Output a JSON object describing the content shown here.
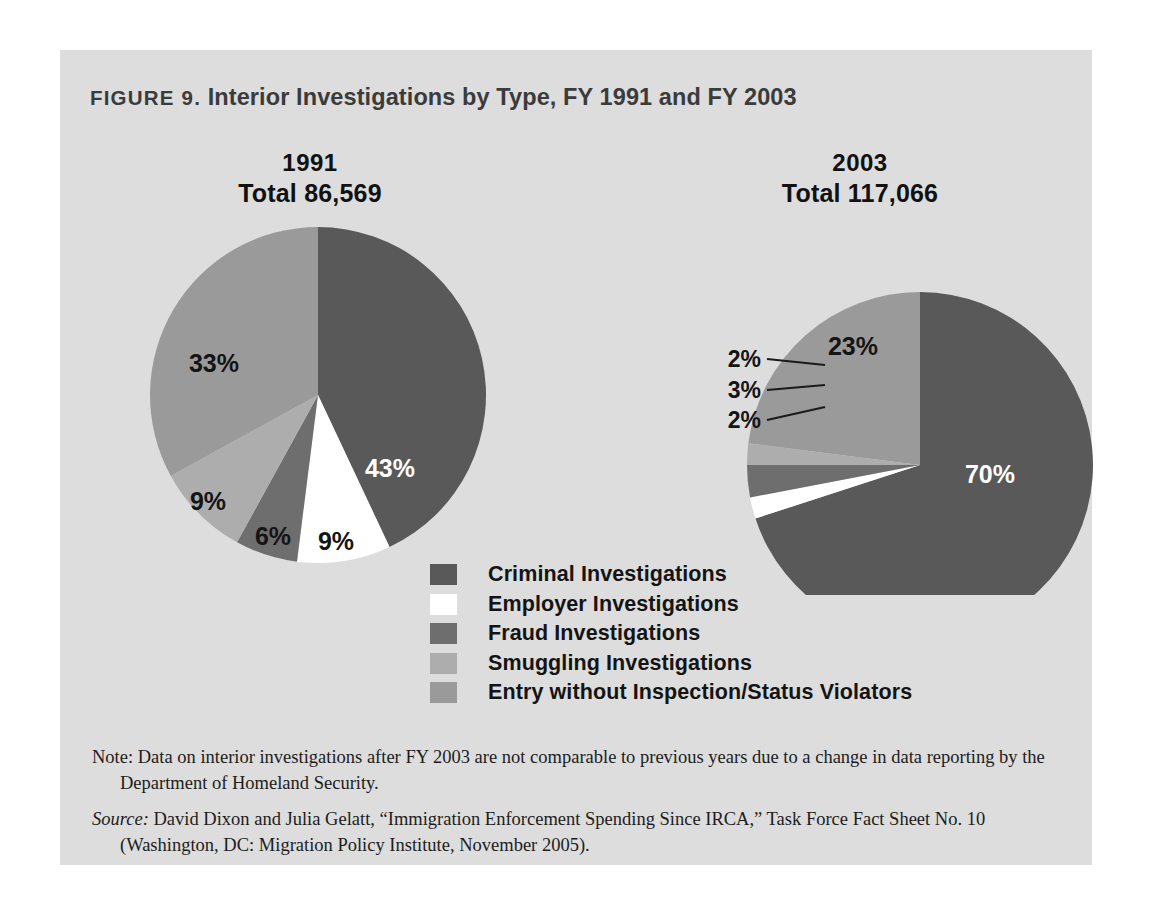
{
  "figure": {
    "label": "FIGURE 9.",
    "title": " Interior Investigations by Type, FY 1991 and FY 2003",
    "panel_bg": "#dddddd",
    "page_bg": "#ffffff"
  },
  "chart_data": {
    "type": "pie",
    "title": "FIGURE 9. Interior Investigations by Type, FY 1991 and FY 2003",
    "legend_position": "bottom-center",
    "categories": [
      "Criminal Investigations",
      "Employer Investigations",
      "Fraud Investigations",
      "Smuggling Investigations",
      "Entry without Inspection/Status Violators"
    ],
    "colors": [
      "#595959",
      "#ffffff",
      "#6e6e6e",
      "#adadad",
      "#9a9a9a"
    ],
    "charts": [
      {
        "name": "1991",
        "year": "1991",
        "total_label": "Total 86,569",
        "total_value": 86569,
        "values": [
          43,
          9,
          6,
          9,
          33
        ],
        "labels": [
          "43%",
          "9%",
          "6%",
          "9%",
          "33%"
        ],
        "label_style": [
          "inside",
          "inside",
          "inside",
          "inside",
          "inside"
        ]
      },
      {
        "name": "2003",
        "year": "2003",
        "total_label": "Total 117,066",
        "total_value": 117066,
        "values": [
          70,
          2,
          3,
          2,
          23
        ],
        "labels": [
          "70%",
          "2%",
          "3%",
          "2%",
          "23%"
        ],
        "label_style": [
          "inside",
          "callout",
          "callout",
          "callout",
          "inside"
        ]
      }
    ]
  },
  "pies": {
    "p1991": {
      "year": "1991",
      "total": "Total 86,569",
      "labels": {
        "criminal": "43%",
        "employer": "9%",
        "fraud": "6%",
        "smuggling": "9%",
        "entry": "33%"
      }
    },
    "p2003": {
      "year": "2003",
      "total": "Total 117,066",
      "labels": {
        "criminal": "70%",
        "employer": "2%",
        "fraud": "3%",
        "smuggling": "2%",
        "entry": "23%"
      }
    }
  },
  "legend": {
    "items": [
      {
        "label": "Criminal Investigations",
        "color": "#595959"
      },
      {
        "label": "Employer Investigations",
        "color": "#ffffff"
      },
      {
        "label": "Fraud Investigations",
        "color": "#6e6e6e"
      },
      {
        "label": "Smuggling Investigations",
        "color": "#adadad"
      },
      {
        "label": "Entry without Inspection/Status Violators",
        "color": "#9a9a9a"
      }
    ]
  },
  "footnotes": {
    "note_lead": "Note:",
    "note_text": " Data on interior investigations after FY 2003 are not comparable to previous years due to a change in data reporting by the Department of Homeland Security.",
    "source_lead": "Source:",
    "source_text": " David Dixon and Julia Gelatt, “Immigration Enforcement Spending Since IRCA,” Task Force Fact Sheet No. 10 (Washington, DC: Migration Policy Institute, November 2005)."
  }
}
